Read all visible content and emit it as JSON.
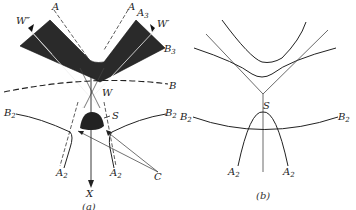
{
  "panels": [
    {
      "id": "a",
      "caption": "(a)",
      "labels": {
        "W_dprime": "W″",
        "A_left": "A",
        "A_right": "A",
        "A3": "A",
        "A3_sub": "3",
        "W_prime": "W′",
        "B3": "B",
        "B3_sub": "3",
        "B": "B",
        "W": "W",
        "S": "S",
        "B2_left": "B",
        "B2_left_sub": "2",
        "B2_right": "B",
        "B2_right_sub": "2",
        "A2_left": "A",
        "A2_left_sub": "2",
        "A2_right": "A",
        "A2_right_sub": "2",
        "X": "X",
        "C": "C"
      }
    },
    {
      "id": "b",
      "caption": "(b)",
      "labels": {
        "S": "S",
        "B2_left": "B",
        "B2_left_sub": "2",
        "B2_right": "B",
        "B2_right_sub": "2",
        "A2_left": "A",
        "A2_left_sub": "2",
        "A2_right": "A",
        "A2_right_sub": "2"
      }
    }
  ]
}
